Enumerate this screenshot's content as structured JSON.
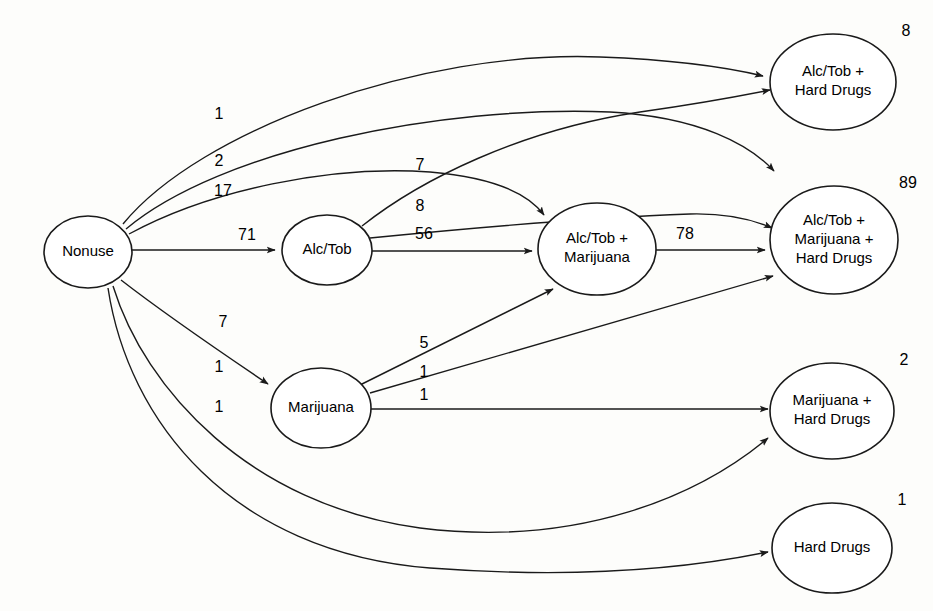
{
  "diagram": {
    "type": "directed-graph",
    "nodes": [
      {
        "id": "nonuse",
        "label_lines": [
          "Nonuse"
        ],
        "count": "",
        "cx": 88,
        "cy": 252,
        "rx": 44,
        "ry": 36
      },
      {
        "id": "alctob",
        "label_lines": [
          "Alc/Tob"
        ],
        "count": "",
        "cx": 327,
        "cy": 250,
        "rx": 45,
        "ry": 35
      },
      {
        "id": "alctob_mj",
        "label_lines": [
          "Alc/Tob +",
          "Marijuana"
        ],
        "count": "",
        "cx": 597,
        "cy": 249,
        "rx": 59,
        "ry": 46
      },
      {
        "id": "marijuana",
        "label_lines": [
          "Marijuana"
        ],
        "count": "",
        "cx": 321,
        "cy": 408,
        "rx": 50,
        "ry": 40
      },
      {
        "id": "alctob_hd",
        "label_lines": [
          "Alc/Tob +",
          "Hard Drugs"
        ],
        "count": "8",
        "cx": 833,
        "cy": 82,
        "rx": 63,
        "ry": 48
      },
      {
        "id": "alctob_mj_hd",
        "label_lines": [
          "Alc/Tob +",
          "Marijuana +",
          "Hard Drugs"
        ],
        "count": "89",
        "cx": 834,
        "cy": 240,
        "rx": 64,
        "ry": 54
      },
      {
        "id": "mj_hd",
        "label_lines": [
          "Marijuana +",
          "Hard Drugs"
        ],
        "count": "2",
        "cx": 832,
        "cy": 411,
        "rx": 62,
        "ry": 48
      },
      {
        "id": "hd",
        "label_lines": [
          "Hard Drugs"
        ],
        "count": "1",
        "cx": 832,
        "cy": 548,
        "rx": 60,
        "ry": 45
      }
    ],
    "edges": [
      {
        "id": "e-nonuse-alctobhd",
        "from": "nonuse",
        "to": "alctob_hd",
        "value": "1",
        "label_x": 219,
        "label_y": 119,
        "path": "M 123,224 C 200,130 420,50 600,57 C 680,60 730,68 763,76"
      },
      {
        "id": "e-nonuse-alctobmjhd",
        "from": "nonuse",
        "to": "alctob_mj_hd",
        "value": "2",
        "label_x": 219,
        "label_y": 166,
        "path": "M 126,229 C 220,150 440,105 610,112 C 700,117 750,145 774,171"
      },
      {
        "id": "e-nonuse-alctobmj",
        "from": "nonuse",
        "to": "alctob_mj",
        "value": "17",
        "label_x": 223,
        "label_y": 196,
        "path": "M 129,234 C 210,190 330,165 430,172 C 500,178 530,196 544,215"
      },
      {
        "id": "e-nonuse-alctob",
        "from": "nonuse",
        "to": "alctob",
        "value": "71",
        "label_x": 247,
        "label_y": 240,
        "path": "M 132,250 L 275,250"
      },
      {
        "id": "e-nonuse-marijuana",
        "from": "nonuse",
        "to": "marijuana",
        "value": "7",
        "label_x": 223,
        "label_y": 327,
        "path": "M 121,280 C 170,318 225,355 268,384"
      },
      {
        "id": "e-nonuse-mjhd",
        "from": "nonuse",
        "to": "mj_hd",
        "value": "1",
        "label_x": 219,
        "label_y": 372,
        "path": "M 113,286 C 145,390 250,505 420,528 C 580,548 700,495 768,438"
      },
      {
        "id": "e-nonuse-hd",
        "from": "nonuse",
        "to": "hd",
        "value": "1",
        "label_x": 219,
        "label_y": 412,
        "path": "M 108,288 C 128,420 230,552 430,568 C 590,580 700,566 768,552"
      },
      {
        "id": "e-alctob-alctobhd",
        "from": "alctob",
        "to": "alctob_hd",
        "value": "7",
        "label_x": 420,
        "label_y": 170,
        "path": "M 362,226 C 420,180 520,130 640,112 C 710,102 745,95 770,90"
      },
      {
        "id": "e-alctob-alctobmjhd",
        "from": "alctob",
        "to": "alctob_mj_hd",
        "value": "8",
        "label_x": 420,
        "label_y": 211,
        "path": "M 370,238 C 450,230 580,218 690,214 C 730,213 756,221 772,228"
      },
      {
        "id": "e-alctob-alctobmj",
        "from": "alctob",
        "to": "alctob_mj",
        "value": "56",
        "label_x": 424,
        "label_y": 239,
        "path": "M 372,251 L 532,251"
      },
      {
        "id": "e-alctobmj-alctobmjhd",
        "from": "alctob_mj",
        "to": "alctob_mj_hd",
        "value": "78",
        "label_x": 685,
        "label_y": 239,
        "path": "M 656,250 L 765,250"
      },
      {
        "id": "e-marijuana-alctobmj",
        "from": "marijuana",
        "to": "alctob_mj",
        "value": "5",
        "label_x": 424,
        "label_y": 348,
        "path": "M 360,385 L 553,289"
      },
      {
        "id": "e-marijuana-alctobmjhd",
        "from": "marijuana",
        "to": "alctob_mj_hd",
        "value": "1",
        "label_x": 424,
        "label_y": 377,
        "path": "M 370,393 L 773,276"
      },
      {
        "id": "e-marijuana-mjhd",
        "from": "marijuana",
        "to": "mj_hd",
        "value": "1",
        "label_x": 424,
        "label_y": 400,
        "path": "M 371,409 L 768,409"
      }
    ],
    "style": {
      "background": "#fdfdfb",
      "node_fill": "#ffffff",
      "stroke": "#1a1a1a",
      "text": "#000000"
    }
  }
}
